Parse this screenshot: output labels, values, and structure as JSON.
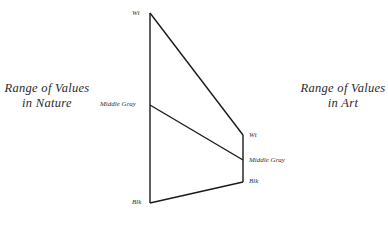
{
  "titles": {
    "nature_line1": "Range of Values",
    "nature_line2": "in Nature",
    "art_line1": "Range of Values",
    "art_line2": "in Art"
  },
  "nature_scale": {
    "top": "Wt",
    "middle": "Middle Gray",
    "bottom": "Blk"
  },
  "art_scale": {
    "top": "Wt",
    "middle": "Middle Gray",
    "bottom": "Blk"
  },
  "colors": {
    "line": "#1a1a1a",
    "text": "#2a2a2a",
    "background": "#ffffff"
  }
}
